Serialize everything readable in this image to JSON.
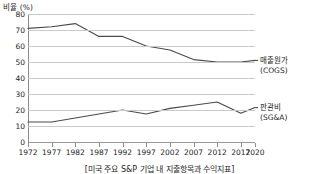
{
  "chart_data": {
    "type": "line",
    "title": "",
    "xlabel": "",
    "ylabel": "비율 (%)",
    "categories": [
      "1972",
      "1977",
      "1982",
      "1987",
      "1992",
      "1997",
      "2002",
      "2007",
      "2012",
      "2017",
      "2020"
    ],
    "x": [
      1972,
      1977,
      1982,
      1987,
      1992,
      1997,
      2002,
      2007,
      2012,
      2017,
      2020
    ],
    "xlim": [
      1972,
      2020
    ],
    "ylim": [
      0,
      80
    ],
    "yticks": [
      0,
      10,
      20,
      30,
      40,
      50,
      60,
      70,
      80
    ],
    "grid": true,
    "legend_position": "right",
    "series": [
      {
        "name": "매출원가 (COGS)",
        "label_main": "매출원가",
        "label_sub": "(COGS)",
        "color": "#4a4a4a",
        "values": [
          71,
          72,
          74,
          66,
          66,
          60,
          57.5,
          51.5,
          50,
          50,
          51
        ]
      },
      {
        "name": "판관비 (SG&A)",
        "label_main": "판관비",
        "label_sub": "(SG&A)",
        "color": "#4a4a4a",
        "values": [
          12.5,
          12.5,
          15,
          17.5,
          20,
          17.5,
          21,
          23,
          25,
          18,
          21.5
        ]
      }
    ]
  },
  "axis": {
    "y_title": "비율 (%)",
    "y_tick_labels": [
      "80",
      "70",
      "60",
      "50",
      "40",
      "30",
      "20",
      "10",
      "0"
    ],
    "x_tick_labels": [
      "1972",
      "1977",
      "1982",
      "1987",
      "1992",
      "1997",
      "2002",
      "2007",
      "2012",
      "2017",
      "2020"
    ]
  },
  "legend": {
    "cogs": {
      "main": "매출원가",
      "sub": "(COGS)"
    },
    "sga": {
      "main": "판관비",
      "sub": "(SG&A)"
    }
  },
  "caption": "[미국 주요 S&P 기업 내 지출항목과 수익지표]",
  "colors": {
    "line": "#4a4a4a",
    "grid": "#c9c9c9",
    "axis": "#8c8c8c",
    "text": "#1e1e1e",
    "background": "#ffffff"
  }
}
